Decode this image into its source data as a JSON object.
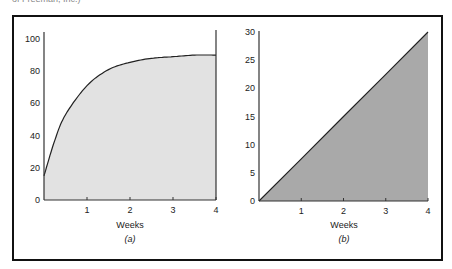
{
  "header": {
    "caption_fragment": "of Freeman, Inc.)"
  },
  "chart_data": [
    {
      "type": "area",
      "panel_label": "(a)",
      "xlabel": "Weeks",
      "ylabel": "",
      "title": "",
      "xlim": [
        0,
        4
      ],
      "ylim": [
        0,
        100
      ],
      "x_ticks": [
        "1",
        "2",
        "3",
        "4"
      ],
      "y_ticks": [
        "0",
        "20",
        "40",
        "60",
        "80",
        "100"
      ],
      "grid": false,
      "fill_color": "#e2e2e2",
      "x": [
        0,
        0.25,
        0.5,
        1,
        1.5,
        2,
        2.5,
        3,
        3.5,
        4
      ],
      "values": [
        15,
        37,
        53,
        71,
        81,
        85.5,
        88,
        89,
        90,
        90
      ],
      "note": "Curve rises steeply then levels off near 90; vertical line at x=4"
    },
    {
      "type": "area",
      "panel_label": "(b)",
      "xlabel": "Weeks",
      "ylabel": "",
      "title": "",
      "xlim": [
        0,
        4
      ],
      "ylim": [
        0,
        30
      ],
      "x_ticks": [
        "1",
        "2",
        "3",
        "4"
      ],
      "y_ticks": [
        "0",
        "5",
        "10",
        "15",
        "20",
        "25",
        "30"
      ],
      "grid": false,
      "fill_color": "#a9a9a9",
      "x": [
        0,
        1,
        2,
        3,
        4
      ],
      "values": [
        0,
        7.5,
        15,
        22.5,
        30
      ],
      "note": "Linear increase from 0 to 30 over 4 weeks, area under line shaded"
    }
  ]
}
